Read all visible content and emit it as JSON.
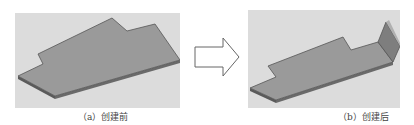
{
  "figure": {
    "panels": [
      {
        "id": "a",
        "caption": "（a）创建前",
        "state": "flat-plate-before-flange"
      },
      {
        "id": "b",
        "caption": "（b）创建后",
        "state": "plate-with-bent-flange-after"
      }
    ],
    "arrow": {
      "direction": "right",
      "meaning": "transformation"
    },
    "colors": {
      "background": "#dcdcdc",
      "plate_top": "#9a9a9a",
      "plate_edge": "#5a5a5a",
      "flange": "#888888",
      "arrow_stroke": "#666666"
    }
  }
}
